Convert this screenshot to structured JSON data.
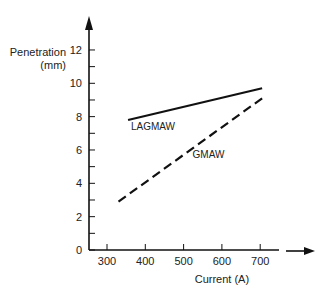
{
  "chart_data": {
    "type": "line",
    "title": "",
    "xlabel": "Current (A)",
    "ylabel": "Penetration\n(mm)",
    "ylabel_lines": [
      "Penetration",
      "(mm)"
    ],
    "xlim": [
      250,
      750
    ],
    "ylim": [
      0,
      12
    ],
    "x_ticks": [
      300,
      400,
      500,
      600,
      700
    ],
    "y_ticks": [
      0,
      2,
      4,
      6,
      8,
      10,
      12
    ],
    "y_minor_ticks": [
      1,
      3,
      5,
      7,
      9,
      11
    ],
    "grid": false,
    "legend": "inline labels",
    "series": [
      {
        "name": "LAGMAW",
        "style": "solid",
        "x": [
          355,
          705
        ],
        "y": [
          7.8,
          9.7
        ],
        "label_at": [
          420,
          7.2
        ]
      },
      {
        "name": "GMAW",
        "style": "dashed",
        "x": [
          330,
          705
        ],
        "y": [
          2.9,
          9.1
        ],
        "label_at": [
          565,
          5.5
        ]
      }
    ]
  }
}
